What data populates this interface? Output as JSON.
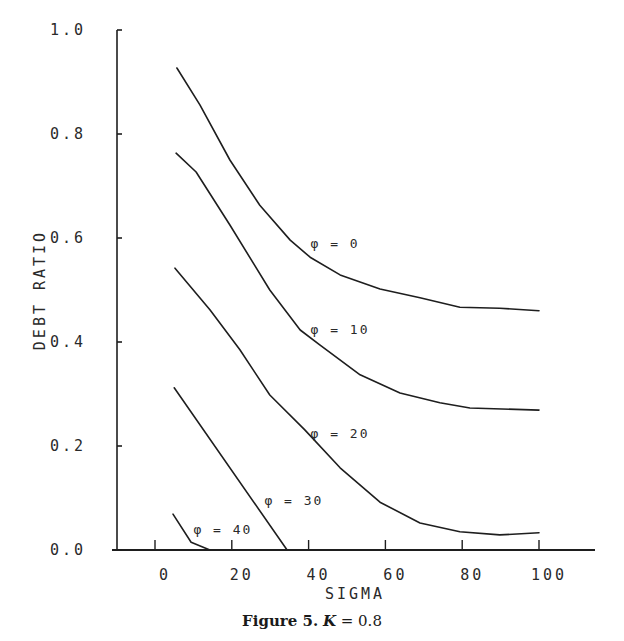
{
  "chart_data": {
    "type": "line",
    "title": "",
    "caption": "Figure 5. K = 0.8",
    "xlabel": "SIGMA",
    "ylabel": "DEBT RATIO",
    "xlim": [
      -10,
      112
    ],
    "ylim": [
      0.0,
      1.0
    ],
    "xticks": [
      0,
      20,
      40,
      60,
      80,
      100
    ],
    "xtick_labels": [
      "0",
      "20",
      "40",
      "60",
      "80",
      "100"
    ],
    "yticks": [
      0.0,
      0.2,
      0.4,
      0.6,
      0.8,
      1.0
    ],
    "ytick_labels": [
      "0.0",
      "0.2",
      "0.4",
      "0.6",
      "0.8",
      "1.0"
    ],
    "grid": false,
    "legend": "inline labels",
    "series": [
      {
        "name": "φ = 0",
        "label_pos": [
          40.5,
          0.58
        ],
        "x": [
          5.7,
          11.7,
          19.5,
          27.3,
          35.2,
          40.4,
          48.2,
          58.6,
          69.0,
          79.4,
          89.8,
          100
        ],
        "y": [
          0.927,
          0.856,
          0.75,
          0.663,
          0.596,
          0.563,
          0.529,
          0.502,
          0.485,
          0.467,
          0.465,
          0.46
        ]
      },
      {
        "name": "φ = 10",
        "label_pos": [
          40.5,
          0.415
        ],
        "x": [
          5.5,
          10.7,
          19.5,
          29.9,
          37.8,
          43.0,
          53.4,
          63.8,
          74.2,
          82.0,
          100
        ],
        "y": [
          0.763,
          0.727,
          0.625,
          0.5,
          0.423,
          0.394,
          0.337,
          0.302,
          0.283,
          0.273,
          0.269
        ]
      },
      {
        "name": "φ = 20",
        "label_pos": [
          40.5,
          0.215
        ],
        "x": [
          5.2,
          14.3,
          22.1,
          29.9,
          39.0,
          48.2,
          58.6,
          69.0,
          79.4,
          89.8,
          100
        ],
        "y": [
          0.542,
          0.462,
          0.385,
          0.298,
          0.231,
          0.158,
          0.092,
          0.052,
          0.035,
          0.029,
          0.033
        ]
      },
      {
        "name": "φ = 30",
        "label_pos": [
          28.5,
          0.087
        ],
        "x": [
          5.0,
          34.4
        ],
        "y": [
          0.312,
          0.0
        ]
      },
      {
        "name": "φ = 40",
        "label_pos": [
          10.0,
          0.03
        ],
        "x": [
          4.7,
          9.4,
          14.3
        ],
        "y": [
          0.069,
          0.015,
          0.0
        ]
      }
    ]
  },
  "caption": {
    "figure": "Figure 5.",
    "k_symbol": "K",
    "k_value": "= 0.8"
  }
}
